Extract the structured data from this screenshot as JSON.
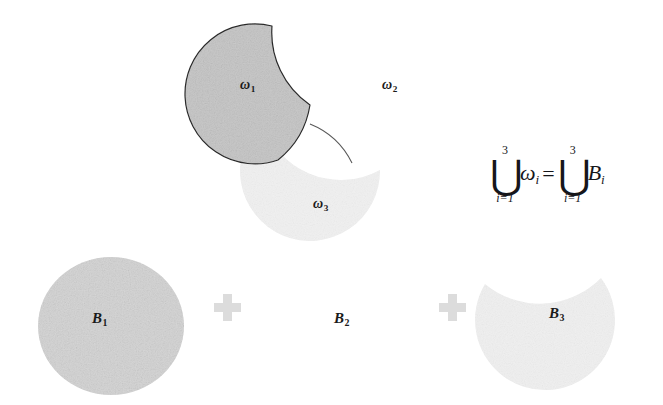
{
  "figure": {
    "background_color": "#ffffff",
    "width": 663,
    "height": 405
  },
  "colors": {
    "omega1_fill": "#c9c9c9",
    "omega1_stroke": "#2b2b2b",
    "omega3_fill": "#f1f1f1",
    "b1_fill": "#d6d6d6",
    "b3_fill": "#f0f0f0",
    "plus_fill": "#dcdcdc",
    "label_color": "#1a1a1a",
    "equation_color": "#16161a"
  },
  "top_row": {
    "regions": [
      {
        "id": "omega1",
        "label": "ω",
        "subscript": "1",
        "shape": "disk-with-crescent-bite",
        "filled": true,
        "outlined": true
      },
      {
        "id": "omega2",
        "label": "ω",
        "subscript": "2",
        "shape": "unfilled-region",
        "filled": false,
        "outlined": false
      },
      {
        "id": "omega3",
        "label": "ω",
        "subscript": "3",
        "shape": "crescent-lune",
        "filled": true,
        "outlined": false
      }
    ]
  },
  "bottom_row": {
    "terms": [
      {
        "id": "B1",
        "label": "B",
        "subscript": "1",
        "shape": "disk",
        "filled": true
      },
      {
        "id": "B2",
        "label": "B",
        "subscript": "2",
        "shape": "unfilled-region",
        "filled": false
      },
      {
        "id": "B3",
        "label": "B",
        "subscript": "3",
        "shape": "crescent-lune",
        "filled": true
      }
    ],
    "operators": [
      {
        "id": "plus-1",
        "symbol": "+"
      },
      {
        "id": "plus-2",
        "symbol": "+"
      }
    ]
  },
  "equation": {
    "lhs": {
      "operator": "⋃",
      "upper_limit": "3",
      "lower_limit": "i=1",
      "term": "ω",
      "term_subscript": "i"
    },
    "relation": "=",
    "rhs": {
      "operator": "⋃",
      "upper_limit": "3",
      "lower_limit": "i=1",
      "term": "B",
      "term_subscript": "i"
    }
  }
}
